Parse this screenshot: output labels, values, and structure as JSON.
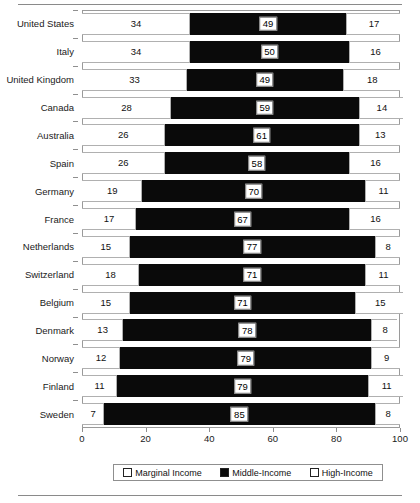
{
  "chart_data": {
    "type": "bar",
    "orientation": "horizontal",
    "stacked": true,
    "title": "",
    "subtitle": "",
    "xlabel": "",
    "ylabel": "",
    "xlim": [
      0,
      100
    ],
    "xticks": [
      0,
      20,
      40,
      60,
      80,
      100
    ],
    "xtick_labels": [
      "0",
      "20",
      "40",
      "60",
      "80",
      "100"
    ],
    "grid": false,
    "legend_position": "bottom",
    "categories": [
      "United States",
      "Italy",
      "United Kingdom",
      "Canada",
      "Australia",
      "Spain",
      "Germany",
      "France",
      "Netherlands",
      "Switzerland",
      "Belgium",
      "Denmark",
      "Norway",
      "Finland",
      "Sweden"
    ],
    "series": [
      {
        "name": "Marginal Income",
        "color": "#ffffff",
        "values": [
          34,
          34,
          33,
          28,
          26,
          26,
          19,
          17,
          15,
          18,
          15,
          13,
          12,
          11,
          7
        ]
      },
      {
        "name": "Middle-Income",
        "color": "#0a0a0a",
        "values": [
          49,
          50,
          49,
          59,
          61,
          58,
          70,
          67,
          77,
          71,
          71,
          78,
          79,
          79,
          85
        ]
      },
      {
        "name": "High-Income",
        "color": "#ffffff",
        "values": [
          17,
          16,
          18,
          14,
          13,
          16,
          11,
          16,
          8,
          11,
          15,
          8,
          9,
          11,
          8
        ]
      }
    ]
  },
  "legend": {
    "items": [
      {
        "label": "Marginal Income",
        "style": "open"
      },
      {
        "label": "Middle-Income",
        "style": "filled"
      },
      {
        "label": "High-Income",
        "style": "open"
      }
    ]
  },
  "colors": {
    "middle_income": "#0a0a0a",
    "open_segment": "#ffffff",
    "border": "#9a9a9a",
    "rule": "#8a8a8a"
  }
}
